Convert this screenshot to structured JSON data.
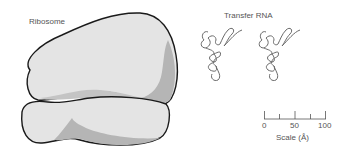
{
  "figure": {
    "ribosome_label": "Ribosome",
    "trna_label": "Transfer RNA",
    "scale": {
      "ticks": [
        "0",
        "50",
        "100"
      ],
      "title": "Scale (Å)"
    }
  },
  "colors": {
    "body_fill": "#e4e4e4",
    "shadow_fill": "#b5b5b5",
    "outline": "#1a1a1a",
    "trna_stroke": "#6a6a6a",
    "text": "#555555"
  }
}
